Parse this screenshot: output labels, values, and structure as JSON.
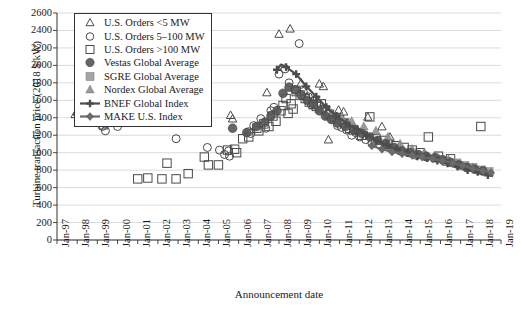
{
  "chart_data": {
    "type": "scatter",
    "title": "",
    "xlabel": "Announcement date",
    "ylabel": "Turbine transaction price (2018 $/kW)",
    "ylim": [
      0,
      2600
    ],
    "ytick_labels": [
      "0",
      "200",
      "400",
      "600",
      "800",
      "1000",
      "1200",
      "1400",
      "1600",
      "1800",
      "2000",
      "2200",
      "2400",
      "2600"
    ],
    "ytick_values": [
      0,
      200,
      400,
      600,
      800,
      1000,
      1200,
      1400,
      1600,
      1800,
      2000,
      2200,
      2400,
      2600
    ],
    "xtick_labels": [
      "Jan-97",
      "Jan-98",
      "Jan-99",
      "Jan-00",
      "Jan-01",
      "Jan-02",
      "Jan-03",
      "Jan-04",
      "Jan-05",
      "Jan-06",
      "Jan-07",
      "Jan-08",
      "Jan-09",
      "Jan-10",
      "Jan-11",
      "Jan-12",
      "Jan-13",
      "Jan-14",
      "Jan-15",
      "Jan-16",
      "Jan-17",
      "Jan-18",
      "Jan-19"
    ],
    "xlim": [
      1997.0,
      2019.0
    ],
    "grid": "horizontal",
    "legend_position": "top-left",
    "series": [
      {
        "name": "U.S. Orders <5 MW",
        "marker": "triangle-open",
        "color": "#4a4a4a",
        "points": [
          [
            1997.9,
            1440
          ],
          [
            1998.0,
            1470
          ],
          [
            2005.6,
            1430
          ],
          [
            2005.7,
            1390
          ],
          [
            2007.4,
            1690
          ],
          [
            2008.0,
            2360
          ],
          [
            2008.55,
            2420
          ],
          [
            2009.1,
            1800
          ],
          [
            2009.4,
            1640
          ],
          [
            2010.0,
            1790
          ],
          [
            2010.2,
            1760
          ],
          [
            2010.45,
            1150
          ],
          [
            2010.95,
            1490
          ],
          [
            2011.2,
            1470
          ],
          [
            2011.9,
            1260
          ],
          [
            2012.4,
            1410
          ],
          [
            2013.1,
            1300
          ],
          [
            2013.5,
            1180
          ]
        ]
      },
      {
        "name": "U.S. Orders 5–100 MW",
        "marker": "circle-open",
        "color": "#4a4a4a",
        "points": [
          [
            1998.25,
            1430
          ],
          [
            1998.7,
            1430
          ],
          [
            1998.5,
            1360
          ],
          [
            1999.25,
            1300
          ],
          [
            1999.4,
            1250
          ],
          [
            2000.0,
            1300
          ],
          [
            2002.9,
            1160
          ],
          [
            2004.45,
            1060
          ],
          [
            2005.05,
            1030
          ],
          [
            2005.3,
            980
          ],
          [
            2005.5,
            1020
          ],
          [
            2005.55,
            960
          ],
          [
            2006.5,
            1240
          ],
          [
            2006.6,
            1220
          ],
          [
            2006.75,
            1310
          ],
          [
            2007.1,
            1390
          ],
          [
            2007.35,
            1280
          ],
          [
            2007.6,
            1480
          ],
          [
            2007.75,
            1520
          ],
          [
            2008.0,
            1900
          ],
          [
            2008.3,
            1960
          ],
          [
            2008.5,
            1800
          ],
          [
            2008.8,
            1720
          ],
          [
            2009.0,
            2250
          ],
          [
            2009.2,
            1700
          ],
          [
            2009.45,
            1640
          ],
          [
            2009.6,
            1550
          ],
          [
            2009.9,
            1540
          ],
          [
            2010.2,
            1500
          ],
          [
            2010.4,
            1440
          ],
          [
            2010.6,
            1400
          ],
          [
            2010.9,
            1310
          ],
          [
            2011.1,
            1290
          ],
          [
            2011.35,
            1260
          ],
          [
            2011.6,
            1200
          ],
          [
            2011.8,
            1230
          ],
          [
            2012.0,
            1180
          ],
          [
            2012.3,
            1150
          ],
          [
            2012.6,
            1110
          ],
          [
            2013.0,
            1090
          ],
          [
            2013.3,
            1070
          ],
          [
            2013.6,
            1050
          ],
          [
            2014.0,
            1020
          ],
          [
            2014.4,
            1000
          ],
          [
            2014.8,
            970
          ],
          [
            2015.3,
            950
          ],
          [
            2015.8,
            940
          ],
          [
            2016.2,
            900
          ],
          [
            2016.8,
            870
          ],
          [
            2017.3,
            840
          ]
        ]
      },
      {
        "name": "U.S. Orders >100 MW",
        "marker": "square-open",
        "color": "#4a4a4a",
        "points": [
          [
            1998.6,
            1370
          ],
          [
            1999.3,
            1320
          ],
          [
            2001.0,
            700
          ],
          [
            2001.5,
            710
          ],
          [
            2002.2,
            700
          ],
          [
            2002.45,
            880
          ],
          [
            2002.9,
            700
          ],
          [
            2003.5,
            760
          ],
          [
            2004.3,
            950
          ],
          [
            2004.5,
            860
          ],
          [
            2005.0,
            860
          ],
          [
            2005.45,
            1030
          ],
          [
            2005.8,
            1040
          ],
          [
            2005.9,
            1000
          ],
          [
            2006.2,
            1160
          ],
          [
            2006.5,
            1180
          ],
          [
            2006.9,
            1280
          ],
          [
            2007.0,
            1250
          ],
          [
            2007.25,
            1330
          ],
          [
            2007.5,
            1300
          ],
          [
            2007.7,
            1420
          ],
          [
            2007.85,
            1360
          ],
          [
            2008.1,
            1480
          ],
          [
            2008.2,
            1540
          ],
          [
            2008.35,
            1620
          ],
          [
            2008.45,
            1450
          ],
          [
            2008.6,
            1560
          ],
          [
            2008.7,
            1500
          ],
          [
            2008.85,
            1700
          ],
          [
            2009.05,
            1660
          ],
          [
            2009.3,
            1620
          ],
          [
            2009.5,
            1580
          ],
          [
            2009.7,
            1550
          ],
          [
            2009.85,
            1530
          ],
          [
            2010.1,
            1560
          ],
          [
            2010.3,
            1490
          ],
          [
            2010.5,
            1440
          ],
          [
            2010.75,
            1400
          ],
          [
            2011.0,
            1380
          ],
          [
            2011.25,
            1340
          ],
          [
            2011.5,
            1280
          ],
          [
            2011.7,
            1260
          ],
          [
            2012.1,
            1200
          ],
          [
            2012.5,
            1410
          ],
          [
            2012.8,
            1160
          ],
          [
            2013.2,
            1140
          ],
          [
            2013.4,
            1100
          ],
          [
            2013.8,
            1080
          ],
          [
            2014.2,
            1060
          ],
          [
            2014.6,
            1030
          ],
          [
            2015.0,
            1000
          ],
          [
            2015.4,
            1180
          ],
          [
            2015.9,
            960
          ],
          [
            2016.5,
            930
          ],
          [
            2018.0,
            1300
          ]
        ]
      },
      {
        "name": "Vestas Global Average",
        "marker": "circle-filled",
        "color": "#555555",
        "points": [
          [
            2005.7,
            1280
          ],
          [
            2006.4,
            1230
          ],
          [
            2006.9,
            1300
          ],
          [
            2007.3,
            1350
          ],
          [
            2007.6,
            1420
          ],
          [
            2007.9,
            1480
          ],
          [
            2008.2,
            1680
          ],
          [
            2008.5,
            1750
          ],
          [
            2008.8,
            1720
          ],
          [
            2009.1,
            1660
          ],
          [
            2009.4,
            1600
          ],
          [
            2009.7,
            1560
          ],
          [
            2010.0,
            1480
          ],
          [
            2010.3,
            1420
          ],
          [
            2010.6,
            1380
          ],
          [
            2010.9,
            1340
          ],
          [
            2011.3,
            1300
          ],
          [
            2011.7,
            1260
          ],
          [
            2012.1,
            1220
          ],
          [
            2012.5,
            1180
          ],
          [
            2012.9,
            1140
          ],
          [
            2013.3,
            1100
          ],
          [
            2013.7,
            1060
          ],
          [
            2014.1,
            1020
          ],
          [
            2014.5,
            1000
          ],
          [
            2014.9,
            980
          ],
          [
            2015.3,
            960
          ],
          [
            2015.7,
            940
          ],
          [
            2016.1,
            920
          ],
          [
            2016.5,
            890
          ],
          [
            2016.9,
            860
          ],
          [
            2017.3,
            830
          ],
          [
            2017.7,
            810
          ],
          [
            2018.1,
            790
          ]
        ]
      },
      {
        "name": "SGRE Global Average",
        "marker": "square-gray",
        "color": "#9a9a9a",
        "points": [
          [
            2016.3,
            900
          ],
          [
            2016.8,
            880
          ],
          [
            2017.2,
            850
          ],
          [
            2017.6,
            830
          ],
          [
            2018.0,
            800
          ],
          [
            2018.4,
            780
          ]
        ]
      },
      {
        "name": "Nordex Global Average",
        "marker": "triangle-gray",
        "color": "#8f8f8f",
        "points": [
          [
            2010.0,
            1500
          ],
          [
            2010.6,
            1450
          ],
          [
            2011.1,
            1400
          ],
          [
            2011.6,
            1360
          ],
          [
            2012.2,
            1300
          ],
          [
            2012.8,
            1250
          ],
          [
            2013.4,
            1180
          ],
          [
            2014.0,
            1100
          ],
          [
            2014.6,
            1040
          ],
          [
            2015.2,
            1000
          ],
          [
            2015.8,
            960
          ],
          [
            2016.4,
            920
          ],
          [
            2017.0,
            870
          ],
          [
            2017.6,
            830
          ],
          [
            2018.2,
            800
          ]
        ]
      },
      {
        "name": "BNEF Global Index",
        "marker": "line-cross",
        "color": "#4d4d4d",
        "points": [
          [
            2007.9,
            1950
          ],
          [
            2008.1,
            2010
          ],
          [
            2008.35,
            1980
          ],
          [
            2008.6,
            1940
          ],
          [
            2008.85,
            1900
          ],
          [
            2009.1,
            1830
          ],
          [
            2009.35,
            1760
          ],
          [
            2009.6,
            1700
          ],
          [
            2009.85,
            1640
          ],
          [
            2010.1,
            1580
          ],
          [
            2010.35,
            1520
          ],
          [
            2010.6,
            1470
          ],
          [
            2010.85,
            1420
          ],
          [
            2011.1,
            1380
          ],
          [
            2011.35,
            1340
          ],
          [
            2011.6,
            1300
          ],
          [
            2011.85,
            1270
          ],
          [
            2012.1,
            1240
          ],
          [
            2012.35,
            1200
          ],
          [
            2012.6,
            1170
          ],
          [
            2012.85,
            1140
          ],
          [
            2013.1,
            1110
          ],
          [
            2013.35,
            1090
          ],
          [
            2013.6,
            1060
          ],
          [
            2013.85,
            1040
          ],
          [
            2014.1,
            1020
          ],
          [
            2014.35,
            1000
          ],
          [
            2014.6,
            980
          ],
          [
            2014.85,
            960
          ],
          [
            2015.1,
            950
          ],
          [
            2015.35,
            940
          ],
          [
            2015.6,
            930
          ],
          [
            2015.85,
            910
          ],
          [
            2016.1,
            900
          ],
          [
            2016.35,
            880
          ],
          [
            2016.6,
            860
          ],
          [
            2016.85,
            840
          ],
          [
            2017.1,
            820
          ],
          [
            2017.35,
            800
          ],
          [
            2017.6,
            790
          ],
          [
            2017.85,
            780
          ],
          [
            2018.1,
            760
          ],
          [
            2018.35,
            745
          ],
          [
            2018.6,
            730
          ]
        ]
      },
      {
        "name": "MAKE U.S. Index",
        "marker": "line-diamond",
        "color": "#6b6b6b",
        "points": [
          [
            2012.6,
            1080
          ],
          [
            2013.1,
            1040
          ],
          [
            2013.6,
            1010
          ],
          [
            2014.1,
            990
          ],
          [
            2014.6,
            970
          ],
          [
            2015.1,
            950
          ],
          [
            2015.6,
            930
          ],
          [
            2016.1,
            910
          ],
          [
            2016.6,
            880
          ],
          [
            2017.1,
            850
          ],
          [
            2017.6,
            820
          ],
          [
            2018.1,
            790
          ],
          [
            2018.5,
            770
          ]
        ]
      }
    ]
  },
  "legend": {
    "items": [
      {
        "label": "U.S. Orders <5 MW",
        "marker": "triangle-open"
      },
      {
        "label": "U.S. Orders 5–100 MW",
        "marker": "circle-open"
      },
      {
        "label": "U.S. Orders >100 MW",
        "marker": "square-open"
      },
      {
        "label": "Vestas Global Average",
        "marker": "circle-filled"
      },
      {
        "label": "SGRE Global Average",
        "marker": "square-gray"
      },
      {
        "label": "Nordex Global Average",
        "marker": "triangle-gray"
      },
      {
        "label": "BNEF Global Index",
        "marker": "line-cross"
      },
      {
        "label": "MAKE U.S. Index",
        "marker": "line-diamond"
      }
    ]
  },
  "colors": {
    "axis": "#333333",
    "grid": "#cccccc",
    "open_marker": "#4a4a4a",
    "vestas": "#555555",
    "sgre": "#9a9a9a",
    "nordex": "#8f8f8f",
    "bnef": "#4d4d4d",
    "make": "#6b6b6b"
  }
}
